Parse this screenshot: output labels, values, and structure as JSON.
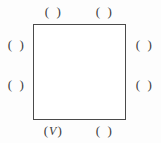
{
  "figure": {
    "shape": {
      "name": "square",
      "stroke_color": "#4a4a4a",
      "fill_color": "#ffffff"
    },
    "background_color": "#fdfdfd",
    "text_color": "#3b3b3b",
    "paren_open": "(",
    "paren_close": ")",
    "slots": [
      {
        "id": "top-left",
        "position": "top-left",
        "content": ""
      },
      {
        "id": "top-right",
        "position": "top-right",
        "content": ""
      },
      {
        "id": "left-upper",
        "position": "left-upper",
        "content": ""
      },
      {
        "id": "left-lower",
        "position": "left-lower",
        "content": ""
      },
      {
        "id": "right-upper",
        "position": "right-upper",
        "content": ""
      },
      {
        "id": "right-lower",
        "position": "right-lower",
        "content": ""
      },
      {
        "id": "bottom-left",
        "position": "bottom-left",
        "content": "V"
      },
      {
        "id": "bottom-right",
        "position": "bottom-right",
        "content": ""
      }
    ]
  }
}
